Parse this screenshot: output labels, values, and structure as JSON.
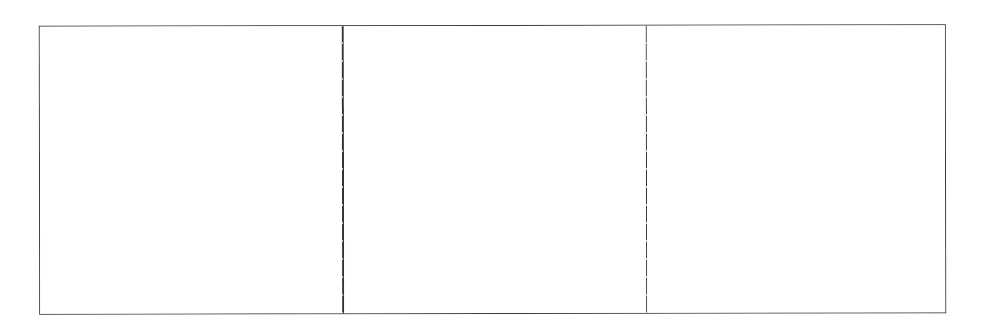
{
  "figure": {
    "layout": "three-panel horizontal strip",
    "panel_count": 3,
    "border_color": "#3a3a3a",
    "background_color": "#ffffff",
    "panels": [
      {
        "id": "panel-1",
        "label": ""
      },
      {
        "id": "panel-2",
        "label": ""
      },
      {
        "id": "panel-3",
        "label": ""
      }
    ]
  }
}
